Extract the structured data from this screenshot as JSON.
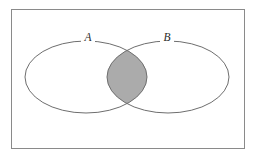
{
  "figure": {
    "kind": "venn-diagram",
    "shaded_region": "A intersect B"
  },
  "frame": {
    "name": "universal-set-rectangle",
    "x": 11,
    "y": 9,
    "width": 234,
    "height": 140,
    "stroke": "#8a8a8a",
    "stroke_width": 1,
    "fill": "#ffffff"
  },
  "sets": [
    {
      "id": "A",
      "label": "A",
      "label_x": 88,
      "label_y": 38,
      "cx": 86,
      "cy": 77,
      "rx": 61,
      "ry": 36,
      "stroke": "#6e6e6e",
      "stroke_width": 1,
      "fill": "none"
    },
    {
      "id": "B",
      "label": "B",
      "label_x": 167,
      "label_y": 38,
      "cx": 168,
      "cy": 77,
      "rx": 61,
      "ry": 36,
      "stroke": "#6e6e6e",
      "stroke_width": 1,
      "fill": "none"
    }
  ],
  "intersection": {
    "name": "intersection-lens",
    "fill": "#ababab",
    "stroke": "#6e6e6e",
    "stroke_width": 1,
    "left_x": 107,
    "right_x": 147,
    "top_y": 50,
    "bottom_y": 105
  },
  "colors": {
    "background": "#ffffff",
    "frame_stroke": "#8a8a8a",
    "curve_stroke": "#6e6e6e",
    "shade_fill": "#ababab",
    "label_text": "#2b2b2b"
  },
  "chart_data": {
    "type": "venn",
    "title": "",
    "sets": [
      "A",
      "B"
    ],
    "regions": [
      {
        "name": "A only",
        "shaded": false
      },
      {
        "name": "B only",
        "shaded": false
      },
      {
        "name": "A and B",
        "shaded": true
      },
      {
        "name": "outside A and B",
        "shaded": false
      }
    ],
    "legend": [],
    "annotations": [
      "A",
      "B"
    ]
  }
}
